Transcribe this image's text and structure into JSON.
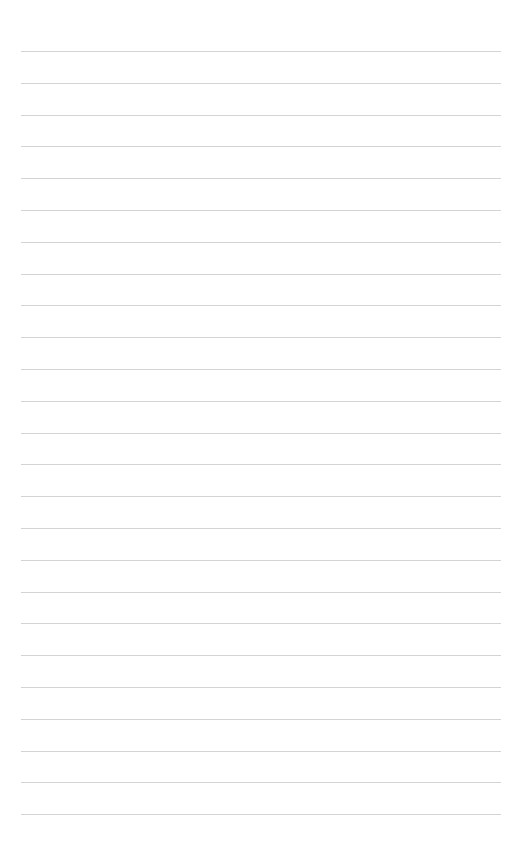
{
  "page": {
    "type": "blank ruled sheet",
    "background_color": "#ffffff",
    "rule_color": "#d4d4d4",
    "rule_count": 25,
    "first_rule_y": 51,
    "rule_spacing": 31.8,
    "rule_left": 21,
    "rule_width": 480
  }
}
